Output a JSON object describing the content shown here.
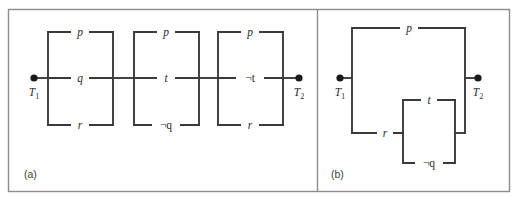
{
  "figure": {
    "background_color": "#ffffff",
    "wire_color": "#3a3a3a",
    "frame_color": "#8c8c8c",
    "terminal_color": "#1a1a1a",
    "panels": [
      {
        "caption": "(a)",
        "terminals": {
          "left": "T",
          "left_sub": "1",
          "right": "T",
          "right_sub": "2"
        },
        "blocks": [
          {
            "name": "block-1",
            "branches": [
              {
                "label": "p",
                "negated": false,
                "position": "top"
              },
              {
                "label": "q",
                "negated": false,
                "position": "middle"
              },
              {
                "label": "r",
                "negated": false,
                "position": "bottom"
              }
            ]
          },
          {
            "name": "block-2",
            "branches": [
              {
                "label": "p",
                "negated": false,
                "position": "top"
              },
              {
                "label": "t",
                "negated": false,
                "position": "middle"
              },
              {
                "label": "q",
                "negated": true,
                "position": "bottom"
              }
            ]
          },
          {
            "name": "block-3",
            "branches": [
              {
                "label": "p",
                "negated": false,
                "position": "top"
              },
              {
                "label": "t",
                "negated": true,
                "position": "middle"
              },
              {
                "label": "r",
                "negated": false,
                "position": "bottom"
              }
            ]
          }
        ]
      },
      {
        "caption": "(b)",
        "terminals": {
          "left": "T",
          "left_sub": "1",
          "right": "T",
          "right_sub": "2"
        },
        "branches": [
          {
            "label": "p",
            "negated": false,
            "position": "outer-top"
          },
          {
            "label": "r",
            "negated": false,
            "position": "outer-bottom"
          },
          {
            "label": "t",
            "negated": false,
            "position": "inner-top"
          },
          {
            "label": "q",
            "negated": true,
            "position": "inner-bottom"
          }
        ]
      }
    ]
  },
  "labels": {
    "neg_symbol": "¬",
    "p": "p",
    "q": "q",
    "r": "r",
    "t": "t",
    "neg_q": "¬q",
    "neg_t": "¬t",
    "T": "T",
    "one": "1",
    "two": "2",
    "caption_a": "(a)",
    "caption_b": "(b)"
  }
}
